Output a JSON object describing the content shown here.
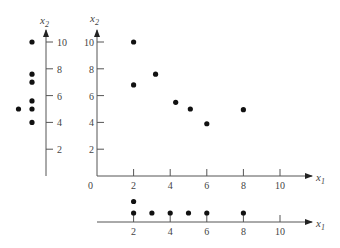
{
  "chart_data": {
    "type": "scatter",
    "title": "",
    "main": {
      "xlabel": "x1",
      "ylabel": "x2",
      "x_ticks": [
        "0",
        "2",
        "4",
        "6",
        "8",
        "10"
      ],
      "y_ticks": [
        "2",
        "4",
        "6",
        "8",
        "10"
      ],
      "xlim": [
        0,
        11
      ],
      "ylim": [
        0,
        10.8
      ],
      "points": [
        {
          "x": 2,
          "y": 10
        },
        {
          "x": 2,
          "y": 6.8
        },
        {
          "x": 3.2,
          "y": 7.6
        },
        {
          "x": 4.3,
          "y": 5.5
        },
        {
          "x": 5.1,
          "y": 5.0
        },
        {
          "x": 6,
          "y": 3.9
        },
        {
          "x": 8,
          "y": 4.95
        }
      ]
    },
    "x2_marginal": {
      "label": "x2",
      "ticks": [
        "2",
        "4",
        "6",
        "8",
        "10"
      ],
      "values": [
        10,
        7.6,
        7.0,
        5.6,
        5.0,
        5.0,
        4.0
      ]
    },
    "x1_marginal": {
      "label": "x1",
      "ticks": [
        "2",
        "4",
        "6",
        "8",
        "10"
      ],
      "values": [
        2,
        2,
        3,
        4,
        5,
        6,
        8
      ]
    }
  },
  "labels": {
    "x1": "x",
    "x1_sub": "1",
    "x2": "x",
    "x2_sub": "2",
    "origin": "0"
  }
}
